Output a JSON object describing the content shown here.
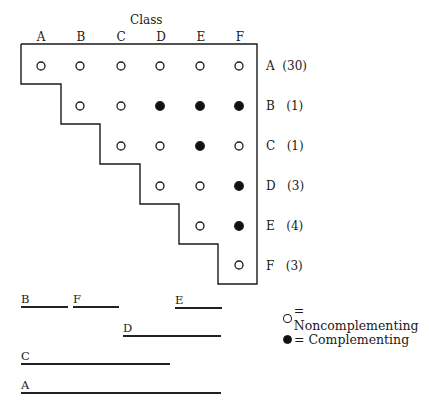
{
  "title": "Class",
  "columns": [
    "A",
    "B",
    "C",
    "D",
    "E",
    "F"
  ],
  "rows": [
    {
      "label": "A",
      "count": "(30)",
      "cells": [
        "open",
        "open",
        "open",
        "open",
        "open",
        "open"
      ]
    },
    {
      "label": "B",
      "count": "(1)",
      "cells": [
        null,
        "open",
        "open",
        "filled",
        "filled",
        "filled"
      ]
    },
    {
      "label": "C",
      "count": "(1)",
      "cells": [
        null,
        null,
        "open",
        "open",
        "filled",
        "open"
      ]
    },
    {
      "label": "D",
      "count": "(3)",
      "cells": [
        null,
        null,
        null,
        "open",
        "open",
        "filled"
      ]
    },
    {
      "label": "E",
      "count": "(4)",
      "cells": [
        null,
        null,
        null,
        null,
        "open",
        "filled"
      ]
    },
    {
      "label": "F",
      "count": "(3)",
      "cells": [
        null,
        null,
        null,
        null,
        null,
        "open"
      ]
    }
  ],
  "legend": {
    "open_label": "= Noncomplementing",
    "filled_label": "= Complementing"
  },
  "map_segments": [
    {
      "label": "B",
      "x1": 21,
      "x2": 68,
      "y": 306
    },
    {
      "label": "F",
      "x1": 73,
      "x2": 119,
      "y": 306
    },
    {
      "label": "E",
      "x1": 175,
      "x2": 222,
      "y": 307
    },
    {
      "label": "D",
      "x1": 123,
      "x2": 221,
      "y": 335
    },
    {
      "label": "C",
      "x1": 21,
      "x2": 170,
      "y": 363
    },
    {
      "label": "A",
      "x1": 21,
      "x2": 221,
      "y": 392
    }
  ]
}
